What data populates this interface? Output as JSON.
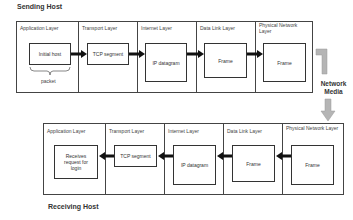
{
  "sending": {
    "title": "Sending Host",
    "layers": [
      {
        "label": "Application Layer",
        "box": "Initial host",
        "note": "packet"
      },
      {
        "label": "Transport Layer",
        "box": "TCP segment"
      },
      {
        "label": "Internet Layer",
        "box": "IP datagram"
      },
      {
        "label": "Data Link Layer",
        "box": "Frame"
      },
      {
        "label": "Physical Network Layer",
        "box": "Frame"
      }
    ]
  },
  "media": {
    "label_line1": "Network",
    "label_line2": "Media"
  },
  "receiving": {
    "title": "Receiving Host",
    "layers": [
      {
        "label": "Application Layer",
        "box": "Receives request for login"
      },
      {
        "label": "Transport Layer",
        "box": "TCP segment"
      },
      {
        "label": "Internet Layer",
        "box": "IP datagram"
      },
      {
        "label": "Data Link Layer",
        "box": "Frame"
      },
      {
        "label": "Physical Network Layer",
        "box": "Frame"
      }
    ]
  },
  "colors": {
    "arrow": "#111111",
    "media_arrow": "#b5b5b5",
    "border": "#444444"
  }
}
